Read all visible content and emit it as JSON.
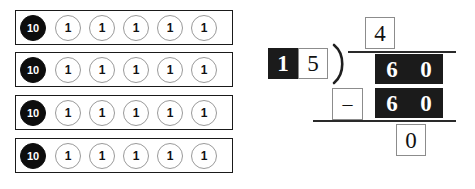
{
  "manipulatives": {
    "label": "base-ten-bars",
    "rows": [
      {
        "ten_label": "10",
        "ones": [
          "1",
          "1",
          "1",
          "1",
          "1"
        ]
      },
      {
        "ten_label": "10",
        "ones": [
          "1",
          "1",
          "1",
          "1",
          "1"
        ]
      },
      {
        "ten_label": "10",
        "ones": [
          "1",
          "1",
          "1",
          "1",
          "1"
        ]
      },
      {
        "ten_label": "10",
        "ones": [
          "1",
          "1",
          "1",
          "1",
          "1"
        ]
      }
    ]
  },
  "division": {
    "quotient": [
      "4"
    ],
    "divisor": [
      "1",
      "5"
    ],
    "dividend": [
      "6",
      "0"
    ],
    "operator": "–",
    "subtrahend": [
      "6",
      "0"
    ],
    "remainder": [
      "0"
    ],
    "bracket_glyph": ")"
  },
  "colors": {
    "fill_dark": "#1b1b1b",
    "fill_light": "#ffffff",
    "box_border": "#8c8c8c",
    "bar_border": "#1a1a1a",
    "rule": "#2a2a2a",
    "chip_one_border": "#9a9a9a"
  }
}
